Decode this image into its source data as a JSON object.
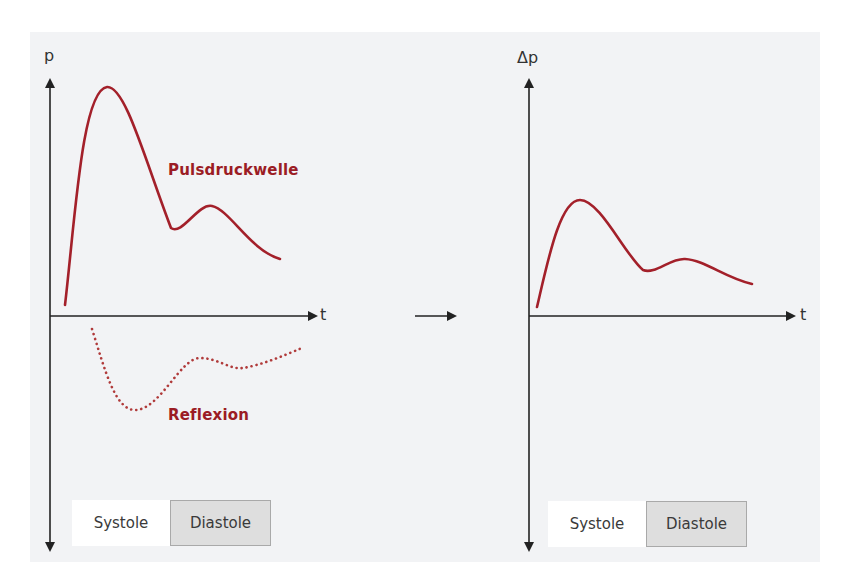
{
  "colors": {
    "background": "#ffffff",
    "panel": "#f2f3f5",
    "axis": "#222222",
    "curve": "#a3202a",
    "curve_label": "#9b1c24",
    "reflexion_curve": "#b03a3a",
    "legend_systole_fill": "#ffffff",
    "legend_diastole_fill": "#dedede",
    "legend_diastole_border": "#a9a9a9"
  },
  "left_diagram": {
    "y_axis_label": "p",
    "x_axis_label": "t",
    "curve_label": "Pulsdruckwelle",
    "reflexion_label": "Reflexion",
    "legend": {
      "systole": "Systole",
      "diastole": "Diastole"
    }
  },
  "transition_arrow": "right-arrow",
  "right_diagram": {
    "y_axis_label": "Δp",
    "x_axis_label": "t",
    "legend": {
      "systole": "Systole",
      "diastole": "Diastole"
    }
  }
}
